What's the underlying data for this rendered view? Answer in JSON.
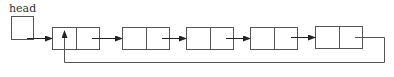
{
  "diagram": {
    "type": "circular-linked-list",
    "head_label": "head",
    "node_count": 5,
    "nodes": [
      {
        "id": "node-1",
        "fields": [
          "data",
          "next"
        ]
      },
      {
        "id": "node-2",
        "fields": [
          "data",
          "next"
        ]
      },
      {
        "id": "node-3",
        "fields": [
          "data",
          "next"
        ]
      },
      {
        "id": "node-4",
        "fields": [
          "data",
          "next"
        ]
      },
      {
        "id": "node-5",
        "fields": [
          "data",
          "next"
        ]
      }
    ],
    "links": [
      {
        "from": "head",
        "to": "node-1"
      },
      {
        "from": "node-1",
        "to": "node-2"
      },
      {
        "from": "node-2",
        "to": "node-3"
      },
      {
        "from": "node-3",
        "to": "node-4"
      },
      {
        "from": "node-4",
        "to": "node-5"
      },
      {
        "from": "node-5",
        "to": "node-1",
        "kind": "back-link"
      }
    ],
    "colors": {
      "stroke": "#555555",
      "arrow": "#222222",
      "background": "#ffffff"
    }
  }
}
